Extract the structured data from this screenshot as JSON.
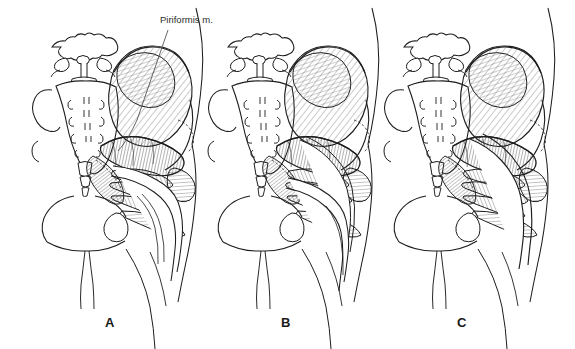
{
  "figure": {
    "style": "pen-and-ink line drawing, black on white",
    "background_color": "#ffffff",
    "ink_color": "#1d1d1d",
    "hatch_color": "#555555",
    "width": 575,
    "height": 349
  },
  "annotations": {
    "piriformis_label": "Piriformis m."
  },
  "panels": [
    {
      "letter": "A",
      "letter_x": 105,
      "letter_y": 315,
      "origin_x": 0,
      "variant": "Sciatic nerve exits undivided below the piriformis muscle",
      "nerve_divisions": 1,
      "nerve_path": "below-piriformis"
    },
    {
      "letter": "B",
      "letter_x": 282,
      "letter_y": 315,
      "origin_x": 176,
      "variant": "Sciatic nerve divided; one division pierces the piriformis, one passes below",
      "nerve_divisions": 2,
      "nerve_path": "through-and-below-piriformis"
    },
    {
      "letter": "C",
      "letter_x": 458,
      "letter_y": 315,
      "origin_x": 352,
      "variant": "Undivided sciatic nerve passes through the piriformis muscle",
      "nerve_divisions": 1,
      "nerve_path": "through-piriformis"
    }
  ],
  "structures": [
    "L5 vertebra",
    "sacrum",
    "sacral foramina",
    "coccyx",
    "ilium",
    "gluteus maximus",
    "gluteus medius",
    "piriformis muscle",
    "superior gemellus",
    "obturator internus",
    "inferior gemellus",
    "quadratus femoris",
    "sacrotuberous ligament",
    "greater trochanter",
    "ischial tuberosity",
    "sciatic nerve",
    "posterior femoral cutaneous nerve",
    "thigh contour"
  ]
}
